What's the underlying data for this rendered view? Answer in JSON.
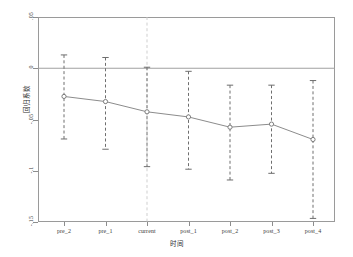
{
  "chart_data": {
    "type": "line",
    "title": "",
    "subtitle": "",
    "xlabel": "时间",
    "ylabel": "回归系数",
    "categories": [
      "pre_2",
      "pre_1",
      "current",
      "post_1",
      "post_2",
      "post_3",
      "post_4"
    ],
    "values": [
      -0.0275,
      -0.0325,
      -0.0425,
      -0.0475,
      -0.0575,
      -0.0545,
      -0.0695
    ],
    "ci_lower": [
      -0.069,
      -0.079,
      -0.096,
      -0.0985,
      -0.109,
      -0.1025,
      -0.1465
    ],
    "ci_upper": [
      0.013,
      0.0105,
      0.001,
      -0.003,
      -0.0165,
      -0.0165,
      -0.012
    ],
    "ylim": [
      -0.15,
      0.05
    ],
    "yticks": [
      0.05,
      0,
      -0.05,
      -0.1,
      -0.15
    ],
    "ytick_labels": [
      ".05",
      "0",
      "-.05",
      "-.1",
      "-.15"
    ],
    "xticks": [
      0,
      1,
      2,
      3,
      4,
      5,
      6
    ],
    "grid": false,
    "legend": false,
    "legend_position": "none",
    "zero_reference_line": 0,
    "event_reference_category": "current",
    "series": [
      {
        "name": "回归系数",
        "values": [
          -0.0275,
          -0.0325,
          -0.0425,
          -0.0475,
          -0.0575,
          -0.0545,
          -0.0695
        ]
      }
    ],
    "annotations": []
  },
  "style": {
    "line_color": "#8c8c8c",
    "marker_color": "#7d7d7d",
    "errorbar_color": "#6e6e6e",
    "zero_line_color": "#a0a0a0",
    "vline_color": "#c9c9c9",
    "frame_color": "#9a9a9a",
    "text_color": "#3a3a3a",
    "background": "#ffffff"
  }
}
